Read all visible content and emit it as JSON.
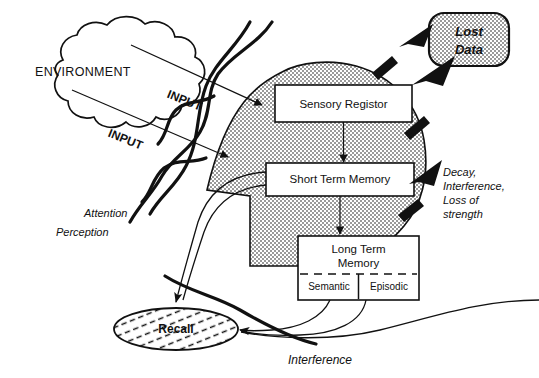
{
  "diagram": {
    "background_color": "#ffffff",
    "ink_color": "#111111",
    "head_fill_color": "#c8c8c8",
    "lost_data_fill_color": "#c8c8c8"
  },
  "environment": {
    "label": "ENVIRONMENT",
    "shape": "cloud"
  },
  "inputs": [
    {
      "label": "INPUT",
      "id": "input-upper"
    },
    {
      "label": "INPUT",
      "id": "input-lower"
    }
  ],
  "senses": {
    "attention_label": "Attention",
    "perception_label": "Perception"
  },
  "memory_stores": [
    {
      "id": "sensory-registor",
      "label": "Sensory Registor",
      "sublabels": []
    },
    {
      "id": "short-term-memory",
      "label": "Short Term Memory",
      "sublabels": []
    },
    {
      "id": "long-term-memory",
      "label_line1": "Long Term",
      "label_line2": "Memory",
      "sublabels": [
        "Semantic",
        "Episodic"
      ]
    }
  ],
  "lost_data": {
    "line1": "Lost",
    "line2": "Data"
  },
  "loss_note": {
    "line1": "Decay,",
    "line2": "Interference,",
    "line3": "Loss of",
    "line4": "strength"
  },
  "recall": {
    "label": "Recall",
    "shape": "ellipse-hatched"
  },
  "interference": {
    "label": "Interference"
  }
}
